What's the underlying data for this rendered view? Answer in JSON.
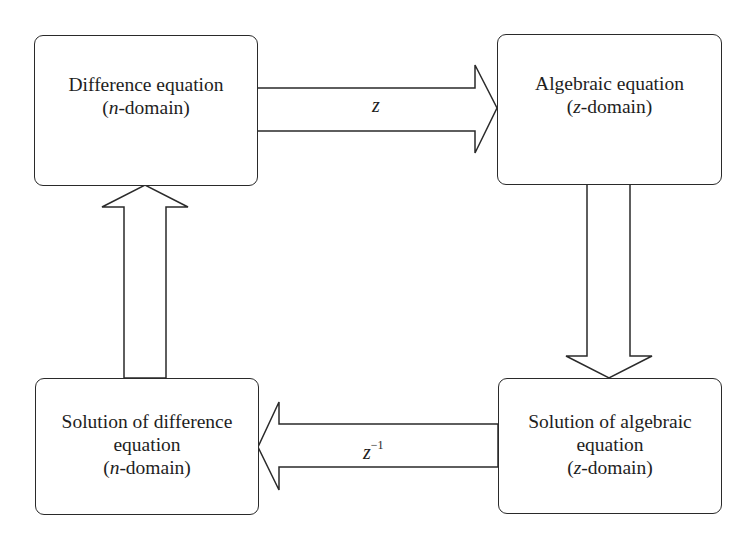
{
  "diagram": {
    "type": "flow-cycle",
    "nodes": [
      {
        "id": "difference-equation",
        "position": "top-left",
        "lines": [
          {
            "parts": [
              {
                "text": "Difference equation",
                "italic": false
              }
            ]
          },
          {
            "parts": [
              {
                "text": "(",
                "italic": false
              },
              {
                "text": "n",
                "italic": true
              },
              {
                "text": "-domain)",
                "italic": false
              }
            ]
          }
        ]
      },
      {
        "id": "algebraic-equation",
        "position": "top-right",
        "lines": [
          {
            "parts": [
              {
                "text": "Algebraic equation",
                "italic": false
              }
            ]
          },
          {
            "parts": [
              {
                "text": "(",
                "italic": false
              },
              {
                "text": "z",
                "italic": true
              },
              {
                "text": "-domain)",
                "italic": false
              }
            ]
          }
        ]
      },
      {
        "id": "solution-difference-equation",
        "position": "bottom-left",
        "lines": [
          {
            "parts": [
              {
                "text": "Solution of difference",
                "italic": false
              }
            ]
          },
          {
            "parts": [
              {
                "text": "equation",
                "italic": false
              }
            ]
          },
          {
            "parts": [
              {
                "text": "(",
                "italic": false
              },
              {
                "text": "n",
                "italic": true
              },
              {
                "text": "-domain)",
                "italic": false
              }
            ]
          }
        ]
      },
      {
        "id": "solution-algebraic-equation",
        "position": "bottom-right",
        "lines": [
          {
            "parts": [
              {
                "text": "Solution of algebraic",
                "italic": false
              }
            ]
          },
          {
            "parts": [
              {
                "text": "equation",
                "italic": false
              }
            ]
          },
          {
            "parts": [
              {
                "text": "(",
                "italic": false
              },
              {
                "text": "z",
                "italic": true
              },
              {
                "text": "-domain)",
                "italic": false
              }
            ]
          }
        ]
      }
    ],
    "edges": [
      {
        "from": "difference-equation",
        "to": "algebraic-equation",
        "direction": "right",
        "label": {
          "base": "z",
          "sup": ""
        }
      },
      {
        "from": "algebraic-equation",
        "to": "solution-algebraic-equation",
        "direction": "down",
        "label": {
          "base": "",
          "sup": ""
        }
      },
      {
        "from": "solution-algebraic-equation",
        "to": "solution-difference-equation",
        "direction": "left",
        "label": {
          "base": "z",
          "sup": "−1"
        }
      },
      {
        "from": "solution-difference-equation",
        "to": "difference-equation",
        "direction": "up",
        "label": {
          "base": "",
          "sup": ""
        }
      }
    ]
  },
  "colors": {
    "stroke": "#2a2a2a",
    "fill": "#ffffff",
    "text": "#1e1e1e",
    "background": "#ffffff"
  }
}
